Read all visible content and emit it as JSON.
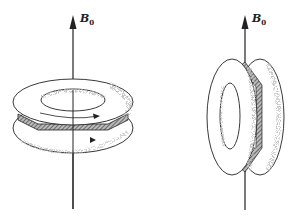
{
  "figure": {
    "left": {
      "axis_label": "B",
      "axis_subscript": "0",
      "description": "Torus with horizontal plane of coils, axis along B0"
    },
    "right": {
      "axis_label": "B",
      "axis_subscript": "0",
      "description": "Torus rotated with vertical plane, B0 in plane of ring"
    }
  },
  "colors": {
    "ink": "#222222",
    "background": "#ffffff",
    "shade": "#777777"
  }
}
